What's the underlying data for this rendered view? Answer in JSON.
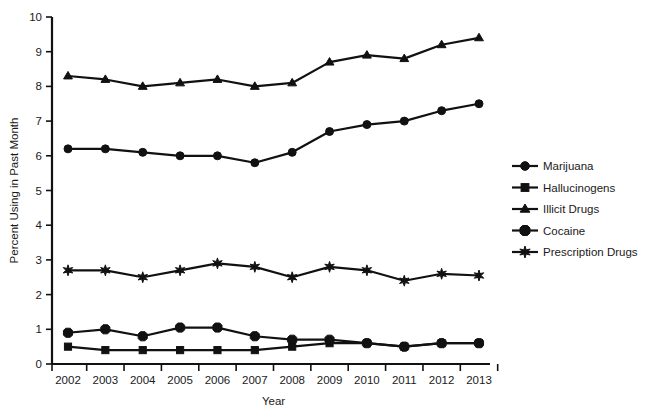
{
  "chart_data": {
    "type": "line",
    "title": "",
    "xlabel": "Year",
    "ylabel": "Percent Using in Past Month",
    "x": [
      2002,
      2003,
      2004,
      2005,
      2006,
      2007,
      2008,
      2009,
      2010,
      2011,
      2012,
      2013
    ],
    "xticklabels": [
      "2002",
      "2003",
      "2004",
      "2005",
      "2006",
      "2007",
      "2008",
      "2009",
      "2010",
      "2011",
      "2012",
      "2013"
    ],
    "yticklabels": [
      "0",
      "1",
      "2",
      "3",
      "4",
      "5",
      "6",
      "7",
      "8",
      "9",
      "10"
    ],
    "ylim": [
      0,
      10
    ],
    "ytick_values": [
      0,
      1,
      2,
      3,
      4,
      5,
      6,
      7,
      8,
      9,
      10
    ],
    "grid": false,
    "legend_position": "right",
    "series": [
      {
        "name": "Marijuana",
        "marker": "circle",
        "values": [
          6.2,
          6.2,
          6.1,
          6.0,
          6.0,
          5.8,
          6.1,
          6.7,
          6.9,
          7.0,
          7.3,
          7.5
        ]
      },
      {
        "name": "Hallucinogens",
        "marker": "square",
        "values": [
          0.5,
          0.4,
          0.4,
          0.4,
          0.4,
          0.4,
          0.5,
          0.6,
          0.6,
          0.5,
          0.6,
          0.6
        ]
      },
      {
        "name": "Illicit Drugs",
        "marker": "triangle",
        "values": [
          8.3,
          8.2,
          8.0,
          8.1,
          8.2,
          8.0,
          8.1,
          8.7,
          8.9,
          8.8,
          9.2,
          9.4
        ]
      },
      {
        "name": "Cocaine",
        "marker": "x",
        "values": [
          0.9,
          1.0,
          0.8,
          1.05,
          1.05,
          0.8,
          0.7,
          0.7,
          0.6,
          0.5,
          0.6,
          0.6
        ]
      },
      {
        "name": "Prescription Drugs",
        "marker": "star",
        "values": [
          2.7,
          2.7,
          2.5,
          2.7,
          2.9,
          2.8,
          2.5,
          2.8,
          2.7,
          2.4,
          2.6,
          2.55
        ]
      }
    ]
  },
  "legend": {
    "items": [
      {
        "label": "Marijuana"
      },
      {
        "label": "Hallucinogens"
      },
      {
        "label": "Illicit Drugs"
      },
      {
        "label": "Cocaine"
      },
      {
        "label": "Prescription Drugs"
      }
    ]
  }
}
